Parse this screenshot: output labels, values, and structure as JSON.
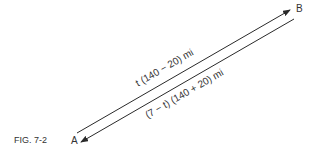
{
  "figure": {
    "caption": "FIG. 7-2",
    "point_a": "A",
    "point_b": "B",
    "upper_label": "t (140 − 20) mi",
    "lower_label": "(7 − t) (140 + 20) mi",
    "line_color": "#2a2a2a"
  }
}
